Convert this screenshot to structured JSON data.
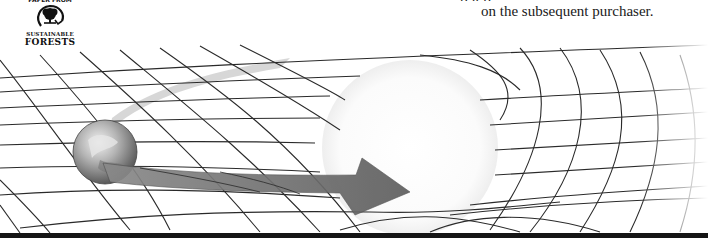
{
  "page": {
    "body_text_cut": "p                                                                g  p",
    "body_text_last_line": "on the subsequent purchaser."
  },
  "logo": {
    "top_cut_text": "PAPER FROM",
    "line1": "SUSTAINABLE",
    "line2": "FORESTS",
    "icon": "tree-in-circle-arrow-icon"
  },
  "illustration": {
    "subject": "spacetime-grid-curvature",
    "elements": [
      "earth-sphere",
      "sun-sphere",
      "orbit-arrow",
      "warped-grid"
    ],
    "colors": {
      "grid": "#2a2a2a",
      "arrow": "#6e6e6e",
      "arrow_trail": "#c8c8c8",
      "sun_glow": "#f4f4f4",
      "bottom_band": "#151515"
    }
  }
}
